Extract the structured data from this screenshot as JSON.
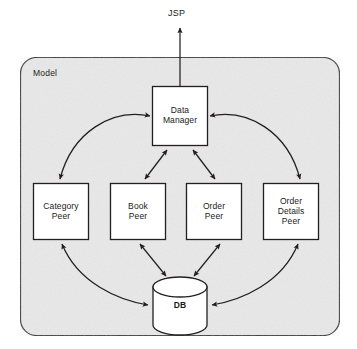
{
  "diagram": {
    "external_node": {
      "id": "jsp",
      "label": "JSP"
    },
    "container": {
      "id": "model",
      "label": "Model",
      "fill": "#e9e9e9",
      "stroke": "#3a3a3a"
    },
    "nodes": [
      {
        "id": "data-manager",
        "label": "Data\nManager",
        "shape": "rect",
        "x": 152,
        "y": 86,
        "w": 56,
        "h": 60
      },
      {
        "id": "category-peer",
        "label": "Category\nPeer",
        "shape": "rect",
        "x": 33,
        "y": 183,
        "w": 56,
        "h": 57
      },
      {
        "id": "book-peer",
        "label": "Book\nPeer",
        "shape": "rect",
        "x": 110,
        "y": 183,
        "w": 56,
        "h": 57
      },
      {
        "id": "order-peer",
        "label": "Order\nPeer",
        "shape": "rect",
        "x": 186,
        "y": 183,
        "w": 56,
        "h": 57
      },
      {
        "id": "order-details-peer",
        "label": "Order\nDetails\nPeer",
        "shape": "rect",
        "x": 263,
        "y": 183,
        "w": 56,
        "h": 57
      },
      {
        "id": "db",
        "label": "DB",
        "shape": "cylinder",
        "x": 152,
        "y": 277,
        "w": 54,
        "h": 58
      }
    ],
    "connections": [
      {
        "id": "jsp-to-data-manager",
        "from": "data-manager",
        "to": "jsp",
        "style": "straight",
        "arrows": "single-up"
      },
      {
        "id": "data-manager-category-peer",
        "from": "data-manager",
        "to": "category-peer",
        "style": "curved",
        "arrows": "double"
      },
      {
        "id": "data-manager-book-peer",
        "from": "data-manager",
        "to": "book-peer",
        "style": "straight",
        "arrows": "double"
      },
      {
        "id": "data-manager-order-peer",
        "from": "data-manager",
        "to": "order-peer",
        "style": "straight",
        "arrows": "double"
      },
      {
        "id": "data-manager-order-details",
        "from": "data-manager",
        "to": "order-details-peer",
        "style": "curved",
        "arrows": "double"
      },
      {
        "id": "category-peer-db",
        "from": "category-peer",
        "to": "db",
        "style": "curved",
        "arrows": "double"
      },
      {
        "id": "book-peer-db",
        "from": "book-peer",
        "to": "db",
        "style": "straight",
        "arrows": "double"
      },
      {
        "id": "order-peer-db",
        "from": "order-peer",
        "to": "db",
        "style": "straight",
        "arrows": "double"
      },
      {
        "id": "order-details-peer-db",
        "from": "order-details-peer",
        "to": "db",
        "style": "curved",
        "arrows": "double"
      }
    ],
    "colors": {
      "node_fill": "#ffffff",
      "node_stroke": "#231f20",
      "line": "#231f20",
      "text": "#1a1a1a",
      "page_background": "#ffffff"
    }
  }
}
